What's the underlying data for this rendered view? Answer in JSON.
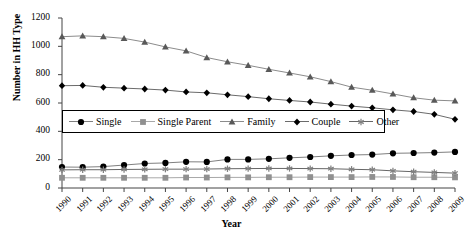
{
  "chart_data": {
    "type": "line",
    "title": "",
    "xlabel": "Year",
    "ylabel": "Number in HH Type",
    "ylim": [
      0,
      1200
    ],
    "ytick_step": 200,
    "yticks": [
      0,
      200,
      400,
      600,
      800,
      1000,
      1200
    ],
    "grid": false,
    "legend_position": "inside-center-left",
    "categories": [
      "1990",
      "1991",
      "1992",
      "1993",
      "1994",
      "1995",
      "1996",
      "1997",
      "1998",
      "1999",
      "2000",
      "2001",
      "2002",
      "2003",
      "2004",
      "2005",
      "2006",
      "2007",
      "2008",
      "2009"
    ],
    "series": [
      {
        "name": "Single",
        "marker": "circle",
        "color": "#000000",
        "line_color": "#808080",
        "values": [
          148,
          147,
          151,
          162,
          173,
          177,
          185,
          184,
          202,
          202,
          206,
          213,
          219,
          227,
          233,
          236,
          245,
          247,
          250,
          255
        ]
      },
      {
        "name": "Single Parent",
        "marker": "square",
        "color": "#909090",
        "line_color": "#a8a8a8",
        "values": [
          72,
          72,
          72,
          72,
          72,
          72,
          74,
          74,
          75,
          75,
          76,
          76,
          77,
          77,
          77,
          78,
          78,
          76,
          76,
          75
        ]
      },
      {
        "name": "Family",
        "marker": "triangle",
        "color": "#595959",
        "line_color": "#8c8c8c",
        "values": [
          1068,
          1074,
          1068,
          1056,
          1030,
          996,
          968,
          921,
          891,
          866,
          838,
          812,
          785,
          751,
          712,
          690,
          664,
          637,
          620,
          615
        ]
      },
      {
        "name": "Couple",
        "marker": "diamond",
        "color": "#000000",
        "line_color": "#6b6b6b",
        "values": [
          722,
          724,
          711,
          705,
          699,
          691,
          678,
          672,
          658,
          645,
          630,
          618,
          607,
          592,
          578,
          566,
          552,
          540,
          520,
          485
        ]
      },
      {
        "name": "Other",
        "marker": "asterisk",
        "color": "#808080",
        "line_color": "#666666",
        "values": [
          128,
          129,
          129,
          131,
          132,
          133,
          133,
          134,
          136,
          137,
          138,
          138,
          137,
          136,
          132,
          129,
          121,
          115,
          110,
          105
        ]
      }
    ]
  },
  "axis": {
    "y_label": "Number in HH Type",
    "x_label": "Year"
  },
  "legend": {
    "entries": [
      {
        "label": "Single"
      },
      {
        "label": "Single Parent"
      },
      {
        "label": "Family"
      },
      {
        "label": "Couple"
      },
      {
        "label": "Other"
      }
    ]
  }
}
